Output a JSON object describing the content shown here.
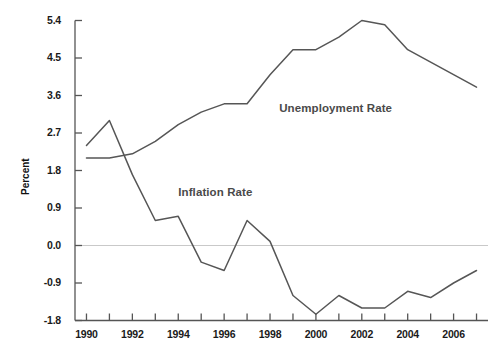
{
  "chart_data": {
    "type": "line",
    "title": "",
    "xlabel": "",
    "ylabel": "Percent",
    "xlim": [
      1989.5,
      2007.5
    ],
    "ylim": [
      -1.8,
      5.4
    ],
    "grid": false,
    "zero_line": true,
    "legend_position": "inline-annotation",
    "y_ticks": [
      "5.4",
      "4.5",
      "3.6",
      "2.7",
      "1.8",
      "0.9",
      "0.0",
      "-0.9",
      "-1.8"
    ],
    "y_tick_values": [
      5.4,
      4.5,
      3.6,
      2.7,
      1.8,
      0.9,
      0.0,
      -0.9,
      -1.8
    ],
    "x_ticks": [
      "1990",
      "1992",
      "1994",
      "1996",
      "1998",
      "2000",
      "2002",
      "2004",
      "2006"
    ],
    "x_tick_values": [
      1990,
      1992,
      1994,
      1996,
      1998,
      2000,
      2002,
      2004,
      2006
    ],
    "x": [
      1990,
      1991,
      1992,
      1993,
      1994,
      1995,
      1996,
      1997,
      1998,
      1999,
      2000,
      2001,
      2002,
      2003,
      2004,
      2005,
      2006,
      2007
    ],
    "series": [
      {
        "name": "Unemployment Rate",
        "color": "#565656",
        "values": [
          2.1,
          2.1,
          2.2,
          2.5,
          2.9,
          3.2,
          3.4,
          3.4,
          4.1,
          4.7,
          4.7,
          5.0,
          5.4,
          5.3,
          4.7,
          4.4,
          4.1,
          3.8
        ]
      },
      {
        "name": "Inflation Rate",
        "color": "#565656",
        "values": [
          2.4,
          3.0,
          1.7,
          0.6,
          0.7,
          -0.4,
          -0.6,
          0.6,
          0.1,
          -1.2,
          -1.65,
          -1.2,
          -1.5,
          -1.5,
          -1.1,
          -1.25,
          -0.9,
          -0.6
        ]
      }
    ],
    "annotations": [
      {
        "text": "Unemployment Rate",
        "x": 1998.4,
        "y": 3.25
      },
      {
        "text": "Inflation Rate",
        "x": 1994.0,
        "y": 1.24
      }
    ]
  },
  "axes": {
    "y_axis_name": "y-axis",
    "x_axis_name": "x-axis",
    "axis_color": "#555555",
    "zero_line_color": "#c9c9c9"
  }
}
